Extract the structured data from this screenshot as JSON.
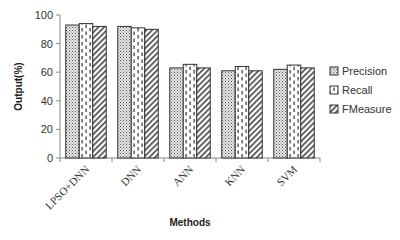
{
  "chart_data": {
    "type": "bar",
    "title": "",
    "xlabel": "Methods",
    "ylabel": "Output(%)",
    "ylim": [
      0,
      100
    ],
    "yticks": [
      0,
      20,
      40,
      60,
      80,
      100
    ],
    "grid": false,
    "legend_position": "right",
    "categories": [
      "LPSO+DNN",
      "DNN",
      "ANN",
      "KNN",
      "SVM"
    ],
    "series": [
      {
        "name": "Precision",
        "pattern": "dots",
        "values": [
          93,
          92,
          63,
          61,
          62
        ]
      },
      {
        "name": "Recall",
        "pattern": "dashes",
        "values": [
          94,
          91,
          65.5,
          64,
          65
        ]
      },
      {
        "name": "FMeasure",
        "pattern": "diagonal",
        "values": [
          92,
          90,
          63,
          61,
          63
        ]
      }
    ]
  }
}
